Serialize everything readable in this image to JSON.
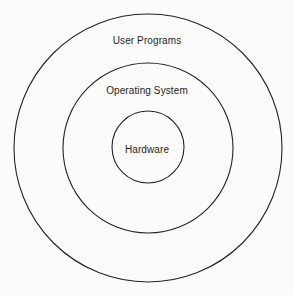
{
  "diagram": {
    "type": "concentric-layers",
    "layers": [
      {
        "label": "User Programs",
        "level": "outer"
      },
      {
        "label": "Operating System",
        "level": "middle"
      },
      {
        "label": "Hardware",
        "level": "inner"
      }
    ],
    "colors": {
      "stroke": "#222222",
      "text": "#1e1e1e",
      "background": "#fbfbf9"
    }
  }
}
